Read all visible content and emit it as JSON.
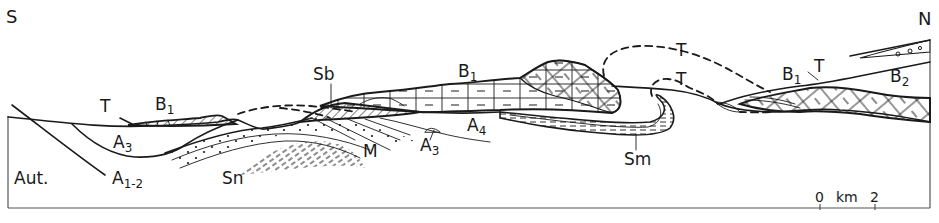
{
  "diagram": {
    "type": "geological-cross-section",
    "orientation": {
      "left": "S",
      "right": "N"
    },
    "units": [
      {
        "id": "aut",
        "label": "Aut."
      },
      {
        "id": "a12",
        "label": "A",
        "sub": "1-2"
      },
      {
        "id": "a3_left",
        "label": "A",
        "sub": "3"
      },
      {
        "id": "a3_mid",
        "label": "A",
        "sub": "3"
      },
      {
        "id": "a4",
        "label": "A",
        "sub": "4"
      },
      {
        "id": "b1_left",
        "label": "B",
        "sub": "1"
      },
      {
        "id": "b1_mid",
        "label": "B",
        "sub": "1"
      },
      {
        "id": "b1_right",
        "label": "B",
        "sub": "1"
      },
      {
        "id": "b2",
        "label": "B",
        "sub": "2"
      },
      {
        "id": "sn",
        "label": "Sn"
      },
      {
        "id": "sb",
        "label": "Sb"
      },
      {
        "id": "m",
        "label": "M"
      },
      {
        "id": "sm",
        "label": "Sm"
      },
      {
        "id": "t_left",
        "label": "T"
      },
      {
        "id": "t_upper",
        "label": "T"
      },
      {
        "id": "t_lower",
        "label": "T"
      },
      {
        "id": "t_right",
        "label": "T"
      }
    ],
    "scale_bar": {
      "start": "0",
      "unit": "km",
      "end": "2"
    },
    "colors": {
      "ink": "#1a1a1a",
      "paper": "#ffffff",
      "frame": "#555555"
    }
  }
}
